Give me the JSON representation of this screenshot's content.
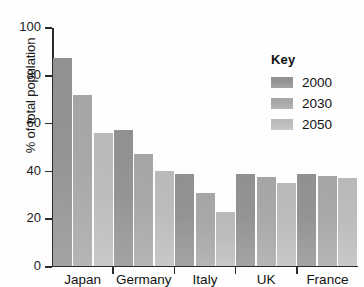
{
  "chart_data": {
    "type": "bar",
    "title": "",
    "subtitle": "",
    "xlabel": "",
    "ylabel": "% of total population",
    "ylim": [
      0,
      100
    ],
    "yticks": [
      0,
      20,
      40,
      60,
      80,
      100
    ],
    "ytick_labels": [
      "0",
      "20",
      "40",
      "60",
      "80",
      "100"
    ],
    "grid": false,
    "legend_position": "top-right",
    "legend_title": "Key",
    "categories": [
      "Japan",
      "Germany",
      "Italy",
      "UK",
      "France"
    ],
    "series": [
      {
        "name": "2000",
        "color": "#8f8f8f",
        "values": [
          87,
          56.5,
          38.5,
          38.5,
          38.5
        ]
      },
      {
        "name": "2030",
        "color": "#a5a5a5",
        "values": [
          71.5,
          46.5,
          30.5,
          37,
          37.5
        ]
      },
      {
        "name": "2050",
        "color": "#b9b9b9",
        "values": [
          55.5,
          39.5,
          22.5,
          34.5,
          36.5
        ]
      }
    ]
  },
  "axis": {
    "y_title": "% of total population"
  },
  "legend": {
    "title": "Key"
  }
}
